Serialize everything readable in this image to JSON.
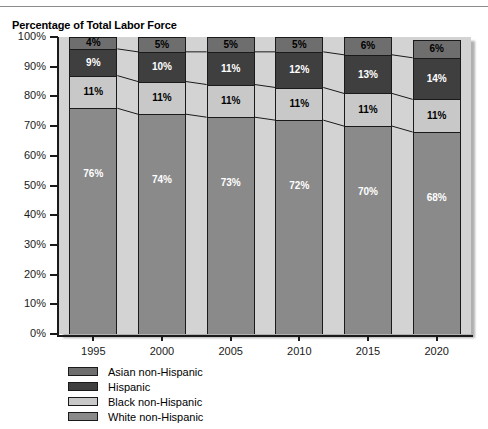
{
  "chart_data": {
    "type": "bar",
    "stacked": true,
    "title": "Percentage of Total Labor Force",
    "xlabel": "",
    "ylabel": "",
    "ylim": [
      0,
      100
    ],
    "grid": false,
    "legend_position": "bottom-left",
    "categories": [
      "1995",
      "2000",
      "2005",
      "2010",
      "2015",
      "2020"
    ],
    "ytick_labels": [
      "100%",
      "90%",
      "80%",
      "70%",
      "60%",
      "50%",
      "40%",
      "30%",
      "20%",
      "10%",
      "0%"
    ],
    "ytick_values": [
      100,
      90,
      80,
      70,
      60,
      50,
      40,
      30,
      20,
      10,
      0
    ],
    "series": [
      {
        "name": "White non-Hispanic",
        "color": "#8a8a8a",
        "label_color": "light",
        "values": [
          76,
          74,
          73,
          72,
          70,
          68
        ],
        "labels": [
          "76%",
          "74%",
          "73%",
          "72%",
          "70%",
          "68%"
        ]
      },
      {
        "name": "Black non-Hispanic",
        "color": "#c8c8c8",
        "label_color": "dark",
        "values": [
          11,
          11,
          11,
          11,
          11,
          11
        ],
        "labels": [
          "11%",
          "11%",
          "11%",
          "11%",
          "11%",
          "11%"
        ]
      },
      {
        "name": "Hispanic",
        "color": "#3f3f3f",
        "label_color": "light",
        "values": [
          9,
          10,
          11,
          12,
          13,
          14
        ],
        "labels": [
          "9%",
          "10%",
          "11%",
          "12%",
          "13%",
          "14%"
        ]
      },
      {
        "name": "Asian non-Hispanic",
        "color": "#6e6e6e",
        "label_color": "dark",
        "values": [
          4,
          5,
          5,
          5,
          6,
          6
        ],
        "labels": [
          "4%",
          "5%",
          "5%",
          "5%",
          "6%",
          "6%"
        ]
      }
    ],
    "legend_entries": [
      {
        "label": "Asian non-Hispanic",
        "color": "#6e6e6e"
      },
      {
        "label": "Hispanic",
        "color": "#3f3f3f"
      },
      {
        "label": "Black non-Hispanic",
        "color": "#c8c8c8"
      },
      {
        "label": "White non-Hispanic",
        "color": "#8a8a8a"
      }
    ],
    "plot_background": "#d3d3d3"
  }
}
